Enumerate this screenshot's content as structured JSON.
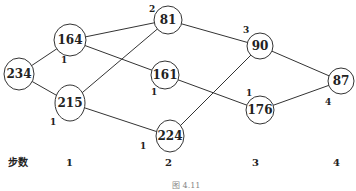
{
  "diagram": {
    "nodes": [
      {
        "id": "n234",
        "label": "234",
        "x": 19,
        "y": 74,
        "rx": 15,
        "ry": 16
      },
      {
        "id": "n164",
        "label": "164",
        "x": 70,
        "y": 40,
        "rx": 16,
        "ry": 16
      },
      {
        "id": "n215",
        "label": "215",
        "x": 70,
        "y": 103,
        "rx": 15,
        "ry": 18
      },
      {
        "id": "n81",
        "label": "81",
        "x": 168,
        "y": 20,
        "rx": 14,
        "ry": 14
      },
      {
        "id": "n161",
        "label": "161",
        "x": 165,
        "y": 75,
        "rx": 14,
        "ry": 14
      },
      {
        "id": "n224",
        "label": "224",
        "x": 170,
        "y": 136,
        "rx": 14,
        "ry": 16
      },
      {
        "id": "n90",
        "label": "90",
        "x": 260,
        "y": 46,
        "rx": 13,
        "ry": 13
      },
      {
        "id": "n176",
        "label": "176",
        "x": 260,
        "y": 110,
        "rx": 14,
        "ry": 14
      },
      {
        "id": "n87",
        "label": "87",
        "x": 341,
        "y": 81,
        "rx": 13,
        "ry": 13
      }
    ],
    "edges": [
      {
        "from": "n234",
        "to": "n164"
      },
      {
        "from": "n234",
        "to": "n215"
      },
      {
        "from": "n164",
        "to": "n81"
      },
      {
        "from": "n164",
        "to": "n161"
      },
      {
        "from": "n215",
        "to": "n81"
      },
      {
        "from": "n215",
        "to": "n224"
      },
      {
        "from": "n81",
        "to": "n90"
      },
      {
        "from": "n161",
        "to": "n176"
      },
      {
        "from": "n224",
        "to": "n90"
      },
      {
        "from": "n90",
        "to": "n87"
      },
      {
        "from": "n176",
        "to": "n87"
      }
    ],
    "weight_labels": [
      {
        "text": "1",
        "x": 61,
        "y": 63
      },
      {
        "text": "1",
        "x": 50,
        "y": 125
      },
      {
        "text": "2",
        "x": 149,
        "y": 12
      },
      {
        "text": "1",
        "x": 151,
        "y": 95
      },
      {
        "text": "1",
        "x": 140,
        "y": 149
      },
      {
        "text": "3",
        "x": 243,
        "y": 33
      },
      {
        "text": "1",
        "x": 246,
        "y": 96
      },
      {
        "text": "4",
        "x": 325,
        "y": 105
      }
    ],
    "steps": {
      "title": "步数",
      "labels": [
        {
          "text": "1",
          "x": 66
        },
        {
          "text": "2",
          "x": 165
        },
        {
          "text": "3",
          "x": 252
        },
        {
          "text": "4",
          "x": 333
        }
      ],
      "y": 163
    },
    "caption": "图 4.11"
  }
}
